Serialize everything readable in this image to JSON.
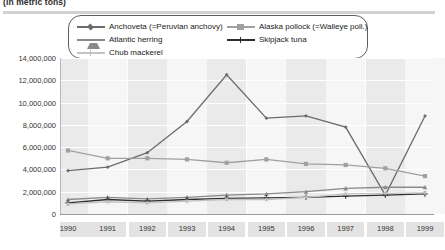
{
  "caption": "(in metric tons)",
  "legend": {
    "items": [
      {
        "label": "Anchoveta (=Peruvian anchovy)",
        "color": "#6b6b6b",
        "marker": "diamond"
      },
      {
        "label": "Alaska pollock (=Walleye poll.)",
        "color": "#a0a0a0",
        "marker": "square"
      },
      {
        "label": "Atlantic herring",
        "color": "#8a8a8a",
        "marker": "triangle"
      },
      {
        "label": "Skipjack tuna",
        "color": "#2e2e2e",
        "marker": "cross"
      },
      {
        "label": "Chub mackerel",
        "color": "#c2c2c2",
        "marker": "star"
      }
    ]
  },
  "chart_data": {
    "type": "line",
    "title": "(in metric tons)",
    "xlabel": "",
    "ylabel": "",
    "x": [
      "1990",
      "1991",
      "1992",
      "1993",
      "1994",
      "1995",
      "1996",
      "1997",
      "1998",
      "1999"
    ],
    "categories": [
      "1990",
      "1991",
      "1992",
      "1993",
      "1994",
      "1995",
      "1996",
      "1997",
      "1998",
      "1999"
    ],
    "ylim": [
      0,
      14000000
    ],
    "ytick_values": [
      0,
      2000000,
      4000000,
      6000000,
      8000000,
      10000000,
      12000000,
      14000000
    ],
    "ytick_labels": [
      "0",
      "2,000,000",
      "4,000,000",
      "6,000,000",
      "8,000,000",
      "10,000,000",
      "12,000,000",
      "14,000,000"
    ],
    "grid": true,
    "legend_position": "top",
    "series": [
      {
        "name": "Anchoveta (=Peruvian anchovy)",
        "color": "#6b6b6b",
        "marker": "diamond",
        "values": [
          3900000,
          4200000,
          5500000,
          8300000,
          12500000,
          8600000,
          8800000,
          7800000,
          1700000,
          8800000
        ]
      },
      {
        "name": "Alaska pollock (=Walleye poll.)",
        "color": "#a0a0a0",
        "marker": "square",
        "values": [
          5700000,
          5000000,
          5000000,
          4900000,
          4600000,
          4900000,
          4500000,
          4400000,
          4100000,
          3400000
        ]
      },
      {
        "name": "Atlantic herring",
        "color": "#8a8a8a",
        "marker": "triangle",
        "values": [
          1300000,
          1500000,
          1350000,
          1500000,
          1700000,
          1800000,
          2000000,
          2300000,
          2400000,
          2400000
        ]
      },
      {
        "name": "Skipjack tuna",
        "color": "#2e2e2e",
        "marker": "cross",
        "values": [
          1000000,
          1300000,
          1150000,
          1300000,
          1400000,
          1450000,
          1500000,
          1600000,
          1700000,
          1800000
        ]
      },
      {
        "name": "Chub mackerel",
        "color": "#c2c2c2",
        "marker": "star",
        "values": [
          900000,
          1100000,
          1000000,
          1150000,
          1300000,
          1300000,
          1500000,
          1800000,
          1850000,
          1900000
        ]
      }
    ]
  }
}
